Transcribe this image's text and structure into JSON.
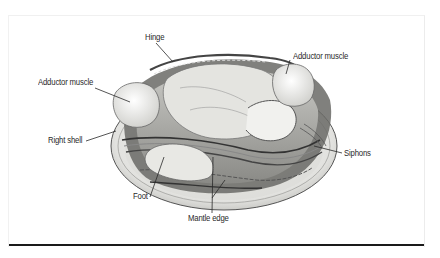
{
  "figure": {
    "labels": {
      "hinge": "Hinge",
      "adductor_left": "Adductor muscle",
      "adductor_right": "Adductor muscle",
      "right_shell": "Right shell",
      "foot": "Foot",
      "mantle_edge": "Mantle edge",
      "siphons": "Siphons"
    }
  },
  "colors": {
    "background": "#ffffff",
    "ink": "#2a2a2a",
    "rule": "#1a1a1a",
    "shell_fill": "#ededeb",
    "shadow": "#3a3a3a"
  }
}
